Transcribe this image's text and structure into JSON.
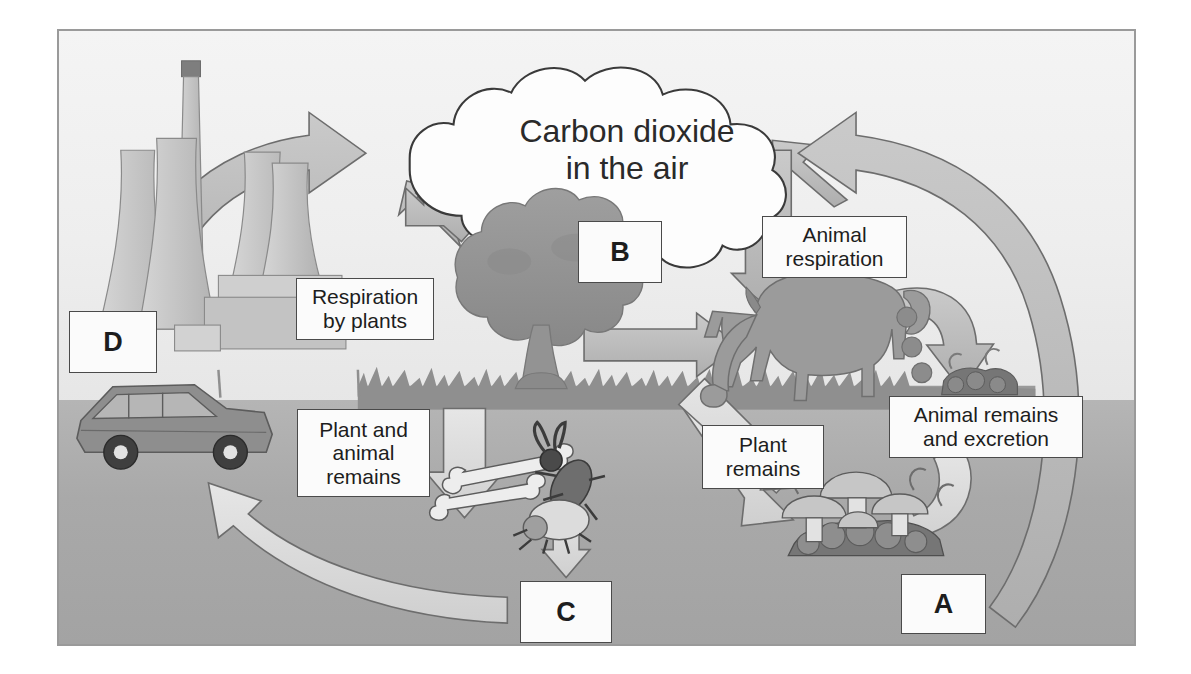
{
  "diagram": {
    "cloud": {
      "name": "carbon-dioxide-cloud",
      "text": "Carbon dioxide\nin the air"
    },
    "labels": [
      {
        "id": "respiration-by-plants",
        "text": "Respiration\nby plants"
      },
      {
        "id": "animal-respiration",
        "text": "Animal\nrespiration"
      },
      {
        "id": "plant-and-animal-remains",
        "text": "Plant and\nanimal\nremains"
      },
      {
        "id": "plant-remains",
        "text": "Plant\nremains"
      },
      {
        "id": "animal-remains-and-excretion",
        "text": "Animal remains\nand excretion"
      }
    ],
    "letter_boxes": [
      {
        "id": "box-a",
        "letter": "A"
      },
      {
        "id": "box-b",
        "letter": "B"
      },
      {
        "id": "box-c",
        "letter": "C"
      },
      {
        "id": "box-d",
        "letter": "D"
      }
    ],
    "illustrations": [
      {
        "id": "power-station",
        "name": "factory-cooling-towers-icon"
      },
      {
        "id": "car",
        "name": "car-icon"
      },
      {
        "id": "tree",
        "name": "tree-icon"
      },
      {
        "id": "horse",
        "name": "grazing-horse-icon"
      },
      {
        "id": "dung",
        "name": "animal-droppings-icon"
      },
      {
        "id": "bones",
        "name": "bones-icon"
      },
      {
        "id": "beetles",
        "name": "beetles-icon"
      },
      {
        "id": "fungi",
        "name": "mushrooms-decomposers-icon"
      }
    ],
    "arrows": [
      {
        "id": "arrow-fossil-fuel-to-air",
        "from": "power-station",
        "to": "carbon-dioxide-cloud"
      },
      {
        "id": "arrow-plant-respiration-to-air",
        "from": "tree",
        "to": "carbon-dioxide-cloud"
      },
      {
        "id": "arrow-air-to-plant",
        "from": "carbon-dioxide-cloud",
        "to": "tree"
      },
      {
        "id": "arrow-plant-to-animal",
        "from": "tree",
        "to": "horse"
      },
      {
        "id": "arrow-animal-respiration-to-air",
        "from": "horse",
        "to": "carbon-dioxide-cloud"
      },
      {
        "id": "arrow-air-to-animal",
        "from": "carbon-dioxide-cloud",
        "to": "horse"
      },
      {
        "id": "arrow-animal-to-remains",
        "from": "horse",
        "to": "animal-remains-and-excretion"
      },
      {
        "id": "arrow-remains-to-decomposers",
        "from": "animal-remains-and-excretion",
        "to": "fungi"
      },
      {
        "id": "arrow-plant-to-decomposers",
        "from": "tree",
        "to": "fungi"
      },
      {
        "id": "arrow-plant-animal-remains-down",
        "from": "plant-and-animal-remains",
        "to": "bones"
      },
      {
        "id": "arrow-remains-to-box-c",
        "from": "bones",
        "to": "box-c"
      },
      {
        "id": "arrow-box-c-to-fossil-fuels",
        "from": "box-c",
        "to": "power-station"
      },
      {
        "id": "arrow-decomposition-to-air",
        "from": "box-a",
        "to": "carbon-dioxide-cloud"
      }
    ],
    "colors": {
      "sky": "#f1f1f1",
      "ground": "#a9a9a9",
      "arrow_fill": "#b9b9b9",
      "arrow_light_fill": "#dcdcdc",
      "arrow_stroke": "#6d6d6d",
      "box_fill": "#fbfbfb",
      "box_stroke": "#4a4a4a",
      "text": "#1d1d1d",
      "frame_stroke": "#9a9a9a",
      "illustration": "#9a9a9a"
    }
  }
}
